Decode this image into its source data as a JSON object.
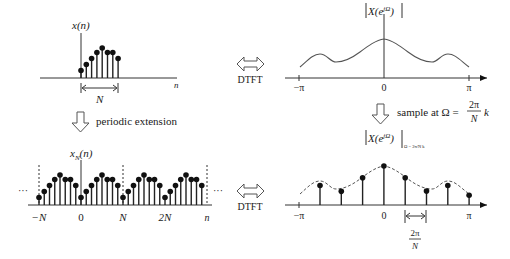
{
  "colors": {
    "ink": "#111111",
    "axis": "#333333",
    "curve": "#555555",
    "background": "#ffffff"
  },
  "top_left": {
    "ylabel": "x(n)",
    "xlabel": "n",
    "span_label": "N",
    "samples": [
      0.25,
      0.45,
      0.65,
      0.85,
      1.0,
      0.85,
      0.85,
      0.65
    ]
  },
  "top_right": {
    "ylabel": "|X(e^{jΩ})|",
    "ylabel_base": "X(e",
    "ylabel_sup": "jΩ",
    "ylabel_close": ")",
    "ticks": [
      "−π",
      "0",
      "π"
    ]
  },
  "bottom_left": {
    "ylabel_base": "x",
    "ylabel_sub": "N",
    "ylabel_arg": "(n)",
    "ticks": [
      "−N",
      "0",
      "N",
      "2N",
      "n"
    ],
    "ellipsis_left": "···",
    "ellipsis_right": "···",
    "periods": 4,
    "samples_per_period": [
      0.25,
      0.45,
      0.65,
      0.85,
      1.0,
      0.85,
      0.85,
      0.65
    ]
  },
  "bottom_right": {
    "ylabel_base": "X(e",
    "ylabel_sup": "jΩ",
    "ylabel_close": ")",
    "ylabel_eval": "Ω = 2π/N k",
    "ticks": [
      "−π",
      "0",
      "π"
    ],
    "spacing_label_num": "2π",
    "spacing_label_den": "N",
    "samples": [
      0.5,
      0.35,
      0.7,
      1.0,
      0.7,
      0.36,
      0.5,
      0.25
    ]
  },
  "arrows": {
    "dtft_top": "DTFT",
    "dtft_bottom": "DTFT",
    "periodic_extension": "periodic extension",
    "sample_at_prefix": "sample at Ω =",
    "sample_at_num": "2π",
    "sample_at_den": "N",
    "sample_at_var": "k"
  }
}
